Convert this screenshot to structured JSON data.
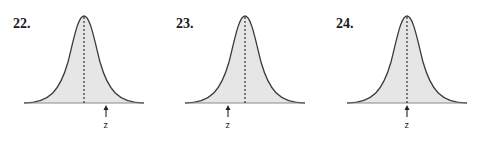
{
  "figures": [
    {
      "number": "22.",
      "z_label": "z",
      "z_position": "right_of_mean",
      "z_offset_px": 22
    },
    {
      "number": "23.",
      "z_label": "z",
      "z_position": "left_of_mean",
      "z_offset_px": -17
    },
    {
      "number": "24.",
      "z_label": "z",
      "z_position": "at_mean",
      "z_offset_px": 0
    }
  ],
  "colors": {
    "fill": "#e6e6e6",
    "curve": "#3a3a3a",
    "baseline": "#8a8a8a",
    "dashed": "#222222"
  }
}
